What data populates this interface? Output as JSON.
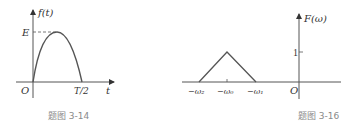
{
  "figures": [
    {
      "id": "left",
      "caption": "题图 3-14",
      "y_axis_label": "f(t)",
      "x_axis_label": "t",
      "origin_label": "O",
      "y_tick_label": "E",
      "x_tick_label": "T/2",
      "shape": "half-sine-like pulse from O to T/2 with peak E"
    },
    {
      "id": "right",
      "caption": "题图 3-16",
      "y_axis_label": "F(ω)",
      "x_axis_label": "ω",
      "origin_label": "O",
      "y_tick_label": "1",
      "x_tick_labels": [
        "−ω₂",
        "−ω₀",
        "−ω₁"
      ],
      "shape": "triangle from −ω₂ to −ω₁ with peak 1 at −ω₀"
    }
  ],
  "colors": {
    "axis": "#555555",
    "curve": "#555555",
    "text": "#333333",
    "caption": "#8a8a8a"
  }
}
